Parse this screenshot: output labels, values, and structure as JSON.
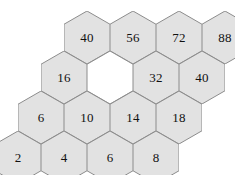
{
  "figure": {
    "type": "hexagonal-number-grid",
    "shape": "pointy-top-hexagon",
    "rows": 4,
    "columns": 4,
    "fill_color": "#e2e2e2",
    "empty_fill_color": "#ffffff",
    "stroke_color": "#8c8c8c",
    "text_color": "#111111",
    "background_color": "#ffffff",
    "hex_width": 46,
    "hex_height": 53,
    "row_vertical_step": 40,
    "row_horizontal_shift": -23,
    "grid": [
      {
        "row_index": 0,
        "left": 64,
        "top": 11,
        "cells": [
          {
            "value": "40",
            "empty": false
          },
          {
            "value": "56",
            "empty": false
          },
          {
            "value": "72",
            "empty": false
          },
          {
            "value": "88",
            "empty": false
          }
        ]
      },
      {
        "row_index": 1,
        "left": 41,
        "top": 51,
        "cells": [
          {
            "value": "16",
            "empty": false
          },
          {
            "value": "",
            "empty": true
          },
          {
            "value": "32",
            "empty": false
          },
          {
            "value": "40",
            "empty": false
          }
        ]
      },
      {
        "row_index": 2,
        "left": 18,
        "top": 91,
        "cells": [
          {
            "value": "6",
            "empty": false
          },
          {
            "value": "10",
            "empty": false
          },
          {
            "value": "14",
            "empty": false
          },
          {
            "value": "18",
            "empty": false
          }
        ]
      },
      {
        "row_index": 3,
        "left": -5,
        "top": 131,
        "cells": [
          {
            "value": "2",
            "empty": false
          },
          {
            "value": "4",
            "empty": false
          },
          {
            "value": "6",
            "empty": false
          },
          {
            "value": "8",
            "empty": false
          }
        ]
      }
    ]
  }
}
